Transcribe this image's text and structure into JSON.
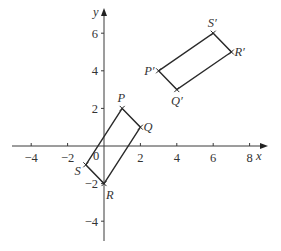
{
  "diagram": {
    "type": "coordinate-grid-transformation",
    "axes": {
      "x_label": "x",
      "y_label": "y",
      "origin_label": "0",
      "x_range": [
        -5,
        9
      ],
      "y_range": [
        -5,
        7
      ],
      "x_ticks": [
        {
          "value": -4,
          "label": "−4"
        },
        {
          "value": -2,
          "label": "−2"
        },
        {
          "value": 2,
          "label": "2"
        },
        {
          "value": 4,
          "label": "4"
        },
        {
          "value": 6,
          "label": "6"
        },
        {
          "value": 8,
          "label": "8"
        }
      ],
      "y_ticks": [
        {
          "value": -4,
          "label": "−4"
        },
        {
          "value": -2,
          "label": "−2"
        },
        {
          "value": 2,
          "label": "2"
        },
        {
          "value": 4,
          "label": "4"
        },
        {
          "value": 6,
          "label": "6"
        }
      ]
    },
    "shapes": [
      {
        "name": "PQRS",
        "vertices": [
          {
            "label": "P",
            "x": 1,
            "y": 2,
            "label_pos": "above"
          },
          {
            "label": "Q",
            "x": 2,
            "y": 1,
            "label_pos": "right"
          },
          {
            "label": "R",
            "x": 0,
            "y": -2,
            "label_pos": "below-right"
          },
          {
            "label": "S",
            "x": -1,
            "y": -1,
            "label_pos": "below-left"
          }
        ]
      },
      {
        "name": "P'Q'R'S'",
        "vertices": [
          {
            "label": "P′",
            "x": 3,
            "y": 4,
            "label_pos": "left"
          },
          {
            "label": "Q′",
            "x": 4,
            "y": 3,
            "label_pos": "below"
          },
          {
            "label": "R′",
            "x": 7,
            "y": 5,
            "label_pos": "right"
          },
          {
            "label": "S′",
            "x": 6,
            "y": 6,
            "label_pos": "above"
          }
        ]
      }
    ]
  }
}
